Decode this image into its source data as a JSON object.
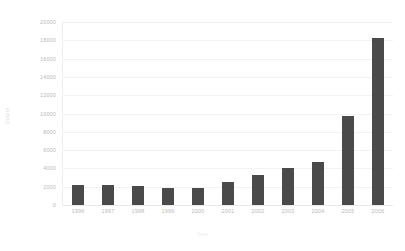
{
  "chart_data": {
    "type": "bar",
    "title": "",
    "xlabel": "Year",
    "ylabel": "Output",
    "categories": [
      "1996",
      "1997",
      "1998",
      "1999",
      "2000",
      "2001",
      "2002",
      "2003",
      "2004",
      "2005",
      "2006"
    ],
    "values": [
      2150,
      2150,
      2100,
      1850,
      1900,
      2500,
      3300,
      4050,
      4750,
      9700,
      18300
    ],
    "ylim": [
      0,
      20000
    ],
    "yticks": [
      0,
      2000,
      4000,
      6000,
      8000,
      10000,
      12000,
      14000,
      16000,
      18000,
      20000
    ],
    "ytick_labels": [
      "0",
      "2000",
      "4000",
      "6000",
      "8000",
      "10000",
      "12000",
      "14000",
      "16000",
      "18000",
      "20000"
    ],
    "grid": true,
    "legend": false,
    "bar_color": "#4a4a4a",
    "grid_color": "#f2f2f2",
    "axis_label_color": "#b9b9b9"
  }
}
